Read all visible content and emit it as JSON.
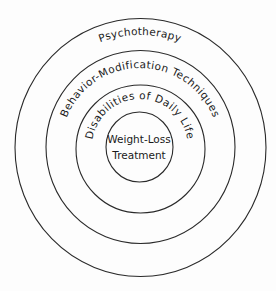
{
  "diagram": {
    "type": "concentric-circles",
    "colors": {
      "line": "#2a2a2a",
      "text": "#1a1a1a",
      "background": "#fdfdfd"
    },
    "rings": [
      {
        "level": 1,
        "label": "Psychotherapy"
      },
      {
        "level": 2,
        "label": "Behavior-Modification Techniques"
      },
      {
        "level": 3,
        "label": "Disabilities of Daily Life"
      }
    ],
    "center": {
      "line1": "Weight-Loss",
      "line2": "Treatment"
    }
  }
}
